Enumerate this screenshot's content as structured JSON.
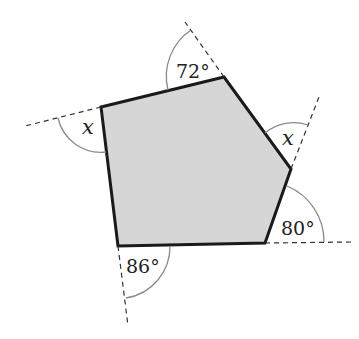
{
  "diagram": {
    "type": "pentagon-exterior-angles",
    "fill_color": "#d6d6d6",
    "edge_color": "#1a1a1a",
    "arc_color": "#8a8a8a",
    "dash_color": "#333333",
    "vertices": [
      {
        "id": "A",
        "x": 101,
        "y": 107
      },
      {
        "id": "B",
        "x": 224,
        "y": 77
      },
      {
        "id": "C",
        "x": 291,
        "y": 169
      },
      {
        "id": "D",
        "x": 265,
        "y": 243
      },
      {
        "id": "E",
        "x": 118,
        "y": 246
      }
    ],
    "extensions": [
      {
        "from": "A",
        "x2": 25,
        "y2": 126
      },
      {
        "from": "B",
        "x2": 185,
        "y2": 22
      },
      {
        "from": "C",
        "x2": 319,
        "y2": 97
      },
      {
        "from": "D",
        "x2": 352,
        "y2": 242
      },
      {
        "from": "E",
        "x2": 128,
        "y2": 326
      }
    ],
    "angle_labels": [
      {
        "vertex": "B",
        "text": "72°",
        "italic": false
      },
      {
        "vertex": "A",
        "text": "x",
        "italic": true
      },
      {
        "vertex": "C",
        "text": "x",
        "italic": true
      },
      {
        "vertex": "D",
        "text": "80°",
        "italic": false
      },
      {
        "vertex": "E",
        "text": "86°",
        "italic": false
      }
    ]
  }
}
